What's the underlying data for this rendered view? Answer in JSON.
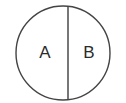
{
  "diagram": {
    "type": "line-art-diagram",
    "canvas": {
      "width": 126,
      "height": 103,
      "background": "#ffffff"
    },
    "shape": {
      "name": "circle",
      "center_x": 63,
      "center_y": 53,
      "radius": 47,
      "stroke_color": "#444444",
      "stroke_width": 1.4,
      "fill_color": "#ffffff"
    },
    "divider": {
      "name": "vertical-diameter",
      "x": 68,
      "y_top": 7,
      "y_bottom": 99,
      "stroke_color": "#555555",
      "stroke_width": 1.6
    },
    "regions": [
      {
        "id": "region-a",
        "label": "A",
        "x": 45,
        "y": 53,
        "side": "left"
      },
      {
        "id": "region-b",
        "label": "B",
        "x": 89,
        "y": 53,
        "side": "right"
      }
    ]
  }
}
